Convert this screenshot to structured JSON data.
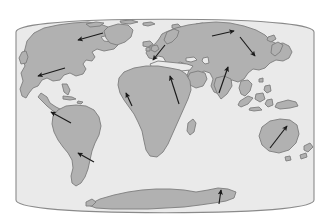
{
  "figure": {
    "title": "World map with tectonic plate motion vectors",
    "projection": "elliptical (Mollweide-style) world projection",
    "canvas": {
      "width": 333,
      "height": 223
    },
    "colors": {
      "page_background": "#ffffff",
      "ocean_fill": "#eaeaea",
      "land_fill": "#b1b1b1",
      "land_stroke": "#7d7d7d",
      "frame_stroke": "#8a8a8a",
      "arrow_color": "#1a1a1a"
    },
    "frame": {
      "type": "ellipse-with-flat-sides",
      "center_x": 165,
      "center_y": 116,
      "radius_x": 149,
      "radius_y": 97,
      "left_edge_x": 16,
      "right_edge_x": 314,
      "top_edge_y": 19,
      "bottom_edge_y": 213
    }
  },
  "landmasses": [
    {
      "name": "north-america",
      "label": "North America"
    },
    {
      "name": "greenland",
      "label": "Greenland"
    },
    {
      "name": "arctic-islands",
      "label": "Canadian Arctic Islands"
    },
    {
      "name": "south-america",
      "label": "South America"
    },
    {
      "name": "africa",
      "label": "Africa"
    },
    {
      "name": "europe-asia",
      "label": "Eurasia"
    },
    {
      "name": "india",
      "label": "India"
    },
    {
      "name": "arabia",
      "label": "Arabian Peninsula"
    },
    {
      "name": "japan",
      "label": "Japan"
    },
    {
      "name": "indonesia",
      "label": "Indonesia"
    },
    {
      "name": "australia",
      "label": "Australia"
    },
    {
      "name": "new-zealand",
      "label": "New Zealand"
    },
    {
      "name": "madagascar",
      "label": "Madagascar"
    },
    {
      "name": "antarctica",
      "label": "Antarctica"
    },
    {
      "name": "iceland",
      "label": "Iceland"
    },
    {
      "name": "british-isles",
      "label": "British Isles"
    },
    {
      "name": "philippines",
      "label": "Philippines"
    },
    {
      "name": "new-guinea",
      "label": "New Guinea"
    }
  ],
  "motion_arrows": [
    {
      "name": "arrow-north-america-north",
      "region": "North America (north)",
      "direction": "west",
      "x1": 103,
      "y1": 33,
      "x2": 78,
      "y2": 40
    },
    {
      "name": "arrow-north-america-west",
      "region": "North America (southwest)",
      "direction": "west",
      "x1": 65,
      "y1": 68,
      "x2": 38,
      "y2": 76
    },
    {
      "name": "arrow-south-america-north",
      "region": "South America (north)",
      "direction": "west-northwest",
      "x1": 71,
      "y1": 123,
      "x2": 51,
      "y2": 112
    },
    {
      "name": "arrow-south-america-south",
      "region": "South America (south)",
      "direction": "west-northwest",
      "x1": 94,
      "y1": 162,
      "x2": 78,
      "y2": 153
    },
    {
      "name": "arrow-africa-west",
      "region": "West Africa",
      "direction": "north",
      "x1": 132,
      "y1": 106,
      "x2": 126,
      "y2": 93
    },
    {
      "name": "arrow-africa-northeast",
      "region": "Northeast Africa / Arabia",
      "direction": "north-northwest",
      "x1": 179,
      "y1": 104,
      "x2": 170,
      "y2": 76
    },
    {
      "name": "arrow-europe",
      "region": "Western Europe",
      "direction": "south-southwest",
      "x1": 165,
      "y1": 45,
      "x2": 153,
      "y2": 60
    },
    {
      "name": "arrow-india",
      "region": "India",
      "direction": "north-northeast",
      "x1": 219,
      "y1": 93,
      "x2": 228,
      "y2": 67
    },
    {
      "name": "arrow-siberia",
      "region": "Northeast Asia",
      "direction": "east-northeast",
      "x1": 212,
      "y1": 36,
      "x2": 234,
      "y2": 31
    },
    {
      "name": "arrow-japan",
      "region": "Japan / Kamchatka",
      "direction": "southeast",
      "x1": 240,
      "y1": 37,
      "x2": 255,
      "y2": 56
    },
    {
      "name": "arrow-australia",
      "region": "Australia",
      "direction": "north-northeast",
      "x1": 270,
      "y1": 148,
      "x2": 287,
      "y2": 126
    },
    {
      "name": "arrow-antarctica",
      "region": "Antarctica",
      "direction": "north",
      "x1": 219,
      "y1": 204,
      "x2": 221,
      "y2": 190
    }
  ]
}
